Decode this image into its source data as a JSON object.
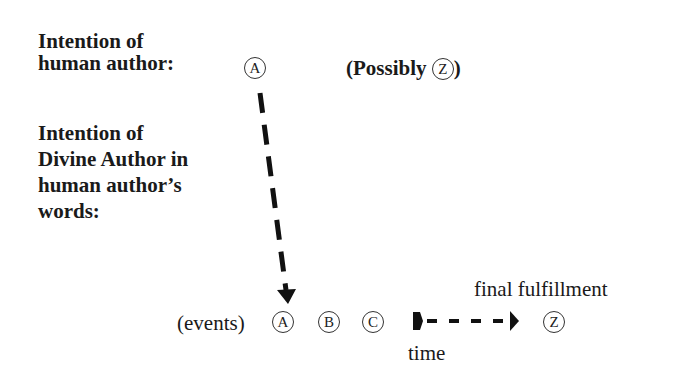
{
  "diagram": {
    "human_intention": {
      "label_lines": [
        "Intention of",
        "human author:"
      ],
      "marker": "A"
    },
    "possibly": {
      "prefix": "(Possibly",
      "marker": "Z",
      "suffix": ")"
    },
    "divine_intention": {
      "label_lines": [
        "Intention of",
        "Divine Author in",
        "human author’s",
        "words:"
      ]
    },
    "events_row": {
      "label": "(events)",
      "markers": [
        "A",
        "B",
        "C"
      ],
      "time_label": "time",
      "final_label": "final fulfillment",
      "final_marker": "Z"
    },
    "connectors": [
      {
        "type": "dashed-arrow",
        "from": "human A",
        "to": "events A",
        "direction": "down"
      },
      {
        "type": "dashed-arrow",
        "from": "events C",
        "to": "final Z",
        "direction": "right"
      }
    ],
    "colors": {
      "ink": "#1a1a1a",
      "background": "#ffffff"
    }
  }
}
